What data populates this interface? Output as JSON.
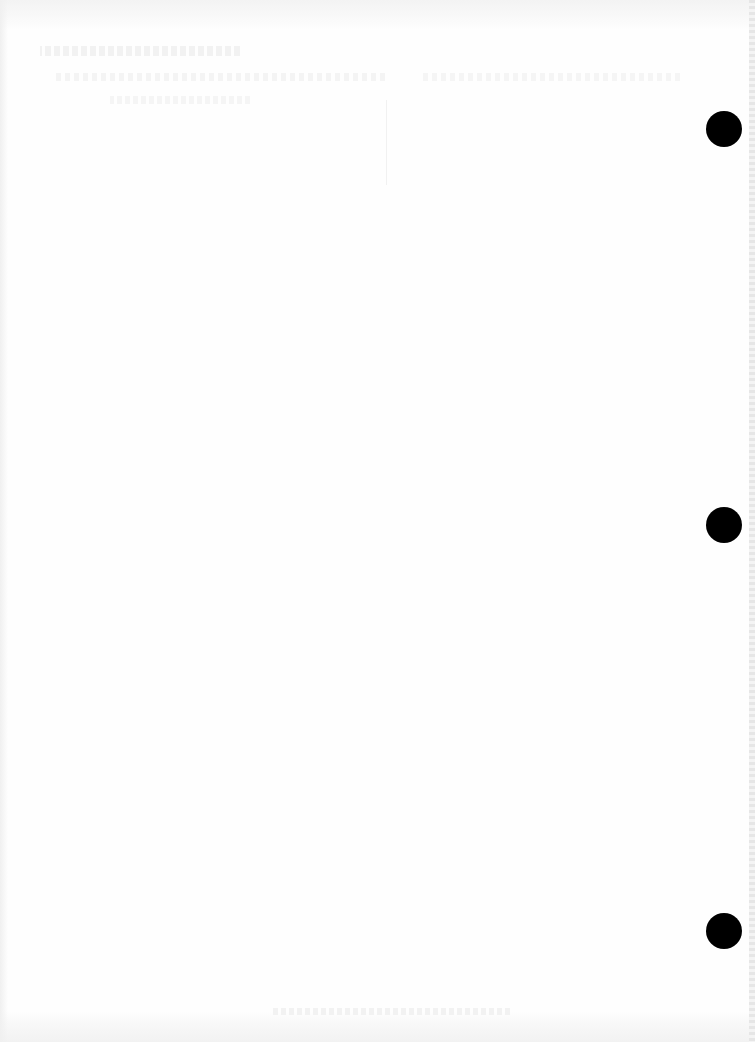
{
  "page": {
    "type": "blank scanned page",
    "background_color": "#fefefe",
    "content_text": ""
  },
  "punch_holes": [
    {
      "label": "top",
      "cx": 724,
      "cy": 129,
      "diameter": 36,
      "color": "#000000"
    },
    {
      "label": "middle",
      "cx": 724,
      "cy": 525,
      "diameter": 36,
      "color": "#000000"
    },
    {
      "label": "bottom",
      "cx": 724,
      "cy": 931,
      "diameter": 36,
      "color": "#000000"
    }
  ]
}
